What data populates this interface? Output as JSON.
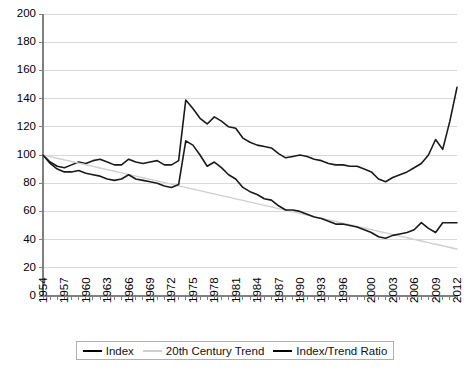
{
  "chart_data": {
    "type": "line",
    "title": "",
    "subtitle": "",
    "xlabel": "",
    "ylabel": "",
    "xlim": [
      1954,
      2012
    ],
    "ylim": [
      0,
      200
    ],
    "yticks": [
      0,
      20,
      40,
      60,
      80,
      100,
      120,
      140,
      160,
      180,
      200
    ],
    "ytick_labels": [
      "0",
      "20",
      "40",
      "60",
      "80",
      "100",
      "120",
      "140",
      "160",
      "180",
      "200"
    ],
    "x": [
      1954,
      1955,
      1956,
      1957,
      1958,
      1959,
      1960,
      1961,
      1962,
      1963,
      1964,
      1965,
      1966,
      1967,
      1968,
      1969,
      1970,
      1971,
      1972,
      1973,
      1974,
      1975,
      1976,
      1977,
      1978,
      1979,
      1980,
      1981,
      1982,
      1983,
      1984,
      1985,
      1986,
      1987,
      1988,
      1989,
      1990,
      1991,
      1992,
      1993,
      1994,
      1995,
      1996,
      1997,
      1998,
      1999,
      2000,
      2001,
      2002,
      2003,
      2004,
      2005,
      2006,
      2007,
      2008,
      2009,
      2010,
      2011,
      2012
    ],
    "xtick_labels": [
      "1954",
      "1957",
      "1960",
      "1963",
      "1966",
      "1969",
      "1972",
      "1975",
      "1978",
      "1981",
      "1984",
      "1987",
      "1990",
      "1993",
      "1996",
      "2000",
      "2003",
      "2006",
      "2009",
      "2012"
    ],
    "xticks": [
      1954,
      1957,
      1960,
      1963,
      1966,
      1969,
      1972,
      1975,
      1978,
      1981,
      1984,
      1987,
      1990,
      1993,
      1996,
      2000,
      2003,
      2006,
      2009,
      2012
    ],
    "grid": "horizontal",
    "legend_position": "bottom",
    "series": [
      {
        "name": "Index",
        "color": "#1a1a1a",
        "width": 1.6,
        "values": [
          100,
          95,
          92,
          91,
          93,
          95,
          94,
          96,
          97,
          95,
          93,
          93,
          97,
          95,
          94,
          95,
          96,
          93,
          93,
          96,
          139,
          133,
          126,
          122,
          127,
          124,
          120,
          119,
          112,
          109,
          107,
          106,
          105,
          101,
          98,
          99,
          100,
          99,
          97,
          96,
          94,
          93,
          93,
          92,
          92,
          90,
          88,
          83,
          81,
          84,
          86,
          88,
          91,
          94,
          100,
          111,
          104,
          124,
          148
        ]
      },
      {
        "name": "20th Century Trend",
        "color": "#cfcfcf",
        "width": 1.4,
        "values": [
          100,
          98.8,
          97.7,
          96.5,
          95.4,
          94.2,
          93.1,
          91.9,
          90.8,
          89.6,
          88.5,
          87.3,
          86.2,
          85.0,
          83.9,
          82.7,
          81.6,
          80.4,
          79.3,
          78.1,
          77.0,
          75.8,
          74.7,
          73.5,
          72.4,
          71.2,
          70.1,
          68.9,
          67.8,
          66.6,
          65.5,
          64.3,
          63.2,
          62.0,
          60.9,
          59.7,
          58.6,
          57.4,
          56.3,
          55.1,
          54.0,
          52.8,
          51.7,
          50.5,
          49.4,
          48.2,
          47.1,
          45.9,
          44.8,
          43.6,
          42.5,
          41.3,
          40.2,
          39.0,
          37.9,
          36.7,
          35.6,
          34.4,
          33.3
        ]
      },
      {
        "name": "Index/Trend Ratio",
        "color": "#1a1a1a",
        "width": 1.6,
        "values": [
          100,
          94,
          90,
          88,
          88,
          89,
          87,
          86,
          85,
          83,
          82,
          83,
          86,
          83,
          82,
          81,
          80,
          78,
          77,
          79,
          110,
          107,
          100,
          92,
          95,
          91,
          86,
          83,
          77,
          74,
          72,
          69,
          68,
          64,
          61,
          61,
          60,
          58,
          56,
          55,
          53,
          51,
          51,
          50,
          49,
          47,
          45,
          42,
          41,
          43,
          44,
          45,
          47,
          52,
          48,
          45,
          52,
          52,
          52
        ]
      }
    ]
  },
  "legend": {
    "entries": [
      {
        "label": "Index"
      },
      {
        "label": "20th Century Trend"
      },
      {
        "label": "Index/Trend Ratio"
      }
    ]
  },
  "colors": {
    "index": "#1a1a1a",
    "trend": "#cfcfcf",
    "ratio": "#1a1a1a",
    "gridline": "#d9d9d9",
    "axis": "#808080",
    "background": "#ffffff"
  }
}
